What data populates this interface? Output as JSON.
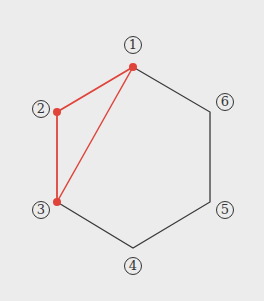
{
  "diagram": {
    "type": "hexagon-graph",
    "colors": {
      "background": "#ececec",
      "edge": "#3a3a3a",
      "highlight": "#e0433a"
    },
    "vertices": [
      {
        "id": "1",
        "label": "1",
        "x": 133,
        "y": 67,
        "highlighted": true
      },
      {
        "id": "2",
        "label": "2",
        "x": 57,
        "y": 112,
        "highlighted": true
      },
      {
        "id": "3",
        "label": "3",
        "x": 57,
        "y": 202,
        "highlighted": true
      },
      {
        "id": "4",
        "label": "4",
        "x": 133,
        "y": 248,
        "highlighted": false
      },
      {
        "id": "5",
        "label": "5",
        "x": 210,
        "y": 202,
        "highlighted": false
      },
      {
        "id": "6",
        "label": "6",
        "x": 210,
        "y": 112,
        "highlighted": false
      }
    ],
    "edges": [
      {
        "from": "1",
        "to": "6",
        "highlighted": false
      },
      {
        "from": "6",
        "to": "5",
        "highlighted": false
      },
      {
        "from": "5",
        "to": "4",
        "highlighted": false
      },
      {
        "from": "4",
        "to": "3",
        "highlighted": false
      },
      {
        "from": "1",
        "to": "2",
        "highlighted": true
      },
      {
        "from": "2",
        "to": "3",
        "highlighted": true
      },
      {
        "from": "1",
        "to": "3",
        "highlighted": true
      }
    ],
    "labels": {
      "v1": "1",
      "v2": "2",
      "v3": "3",
      "v4": "4",
      "v5": "5",
      "v6": "6"
    }
  }
}
